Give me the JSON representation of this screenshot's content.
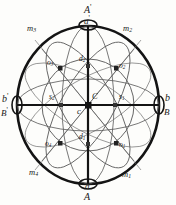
{
  "figure": {
    "colors": {
      "ink": "#1a1a1a",
      "outline": "#111111",
      "thin_line": "#4a4a4a",
      "background": "#fdfdfb"
    },
    "geometry": {
      "center": {
        "x": 88,
        "y": 105
      },
      "radius_x": 72,
      "radius_y": 80,
      "inner_radius_x": 46,
      "inner_radius_y": 46
    },
    "poles": {
      "top_upper": {
        "label": "A",
        "prime": "'",
        "x": 88,
        "y": 11
      },
      "top_lower": {
        "label": "a",
        "prime": "'",
        "x": 88,
        "y": 24
      },
      "bottom_upper": {
        "label": "a",
        "prime": "",
        "x": 88,
        "y": 185
      },
      "bottom_lower": {
        "label": "A",
        "prime": "",
        "x": 88,
        "y": 196
      }
    },
    "equator_points": {
      "left_upper": {
        "label": "b",
        "prime": "'",
        "x": 6,
        "y": 97
      },
      "left_lower": {
        "label": "B",
        "prime": "'",
        "x": 4,
        "y": 110
      },
      "right_upper": {
        "label": "b",
        "prime": "",
        "x": 166,
        "y": 97
      },
      "right_lower": {
        "label": "B",
        "prime": "",
        "x": 165,
        "y": 110
      }
    },
    "center_labels": [
      {
        "name": "center-C",
        "text": "C",
        "x": 92,
        "y": 96
      },
      {
        "name": "center-c",
        "text": "c",
        "x": 79,
        "y": 108
      }
    ],
    "meridian_labels": [
      {
        "name": "m3",
        "base": "m",
        "sub": "3",
        "x": 28,
        "y": 27
      },
      {
        "name": "m2",
        "base": "m",
        "sub": "2",
        "x": 124,
        "y": 27
      },
      {
        "name": "m4",
        "base": "m",
        "sub": "4",
        "x": 30,
        "y": 170
      },
      {
        "name": "m1",
        "base": "m",
        "sub": "1",
        "x": 123,
        "y": 172
      }
    ],
    "intersection_labels": [
      {
        "name": "o3",
        "base": "o",
        "sub": "3",
        "x": 48,
        "y": 62
      },
      {
        "name": "o2",
        "base": "o",
        "sub": "2",
        "x": 111,
        "y": 63
      },
      {
        "name": "o4",
        "base": "o",
        "sub": "4",
        "x": 44,
        "y": 141
      },
      {
        "name": "o1",
        "base": "o",
        "sub": "1",
        "x": 113,
        "y": 143
      }
    ],
    "axis_point_labels": [
      {
        "name": "d2",
        "base": "d",
        "sub": "2",
        "x": 80,
        "y": 57
      },
      {
        "name": "d1",
        "base": "d",
        "sub": "1",
        "x": 79,
        "y": 135
      },
      {
        "name": "s2",
        "base": "s",
        "sub": "2",
        "x": 50,
        "y": 92
      },
      {
        "name": "s1",
        "base": "s",
        "sub": "1",
        "x": 118,
        "y": 93
      }
    ],
    "node_points": [
      {
        "name": "node-center",
        "x": 88,
        "y": 105,
        "size": "large"
      },
      {
        "name": "node-d2",
        "x": 88,
        "y": 66,
        "size": "small"
      },
      {
        "name": "node-d1",
        "x": 88,
        "y": 144,
        "size": "small"
      },
      {
        "name": "node-s2",
        "x": 61,
        "y": 105,
        "size": "small"
      },
      {
        "name": "node-s1",
        "x": 115,
        "y": 105,
        "size": "small"
      },
      {
        "name": "node-o3",
        "x": 60,
        "y": 68,
        "size": "small"
      },
      {
        "name": "node-o2",
        "x": 116,
        "y": 68,
        "size": "small"
      },
      {
        "name": "node-o4",
        "x": 60,
        "y": 143,
        "size": "small"
      },
      {
        "name": "node-o1",
        "x": 116,
        "y": 143,
        "size": "small"
      },
      {
        "name": "node-pole-top",
        "x": 88,
        "y": 26,
        "size": "pole"
      },
      {
        "name": "node-pole-bottom",
        "x": 88,
        "y": 183,
        "size": "pole"
      },
      {
        "name": "node-eq-left",
        "x": 17,
        "y": 105,
        "size": "pole"
      },
      {
        "name": "node-eq-right",
        "x": 159,
        "y": 105,
        "size": "pole"
      }
    ]
  }
}
